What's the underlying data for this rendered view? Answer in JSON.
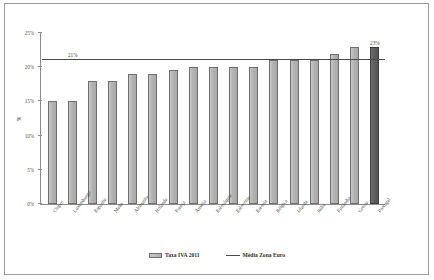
{
  "chart_data": {
    "type": "bar",
    "title": "",
    "subtitle": "",
    "xlabel": "",
    "ylabel": "%",
    "ylim": [
      0,
      25
    ],
    "ytick_labels": [
      "0%",
      "5%",
      "10%",
      "15%",
      "20%",
      "25%"
    ],
    "ytick_values": [
      0,
      5,
      10,
      15,
      20,
      25
    ],
    "grid": false,
    "legend_position": "bottom",
    "categories": [
      "Chipre",
      "Luxemburgo",
      "Espanha",
      "Malta",
      "Alemanha",
      "Holanda",
      "França",
      "Áustria",
      "Eslováquia",
      "Eslovénia",
      "Estónia",
      "Bélgica",
      "Irlanda",
      "Itália",
      "Finlândia",
      "Grécia",
      "Portugal"
    ],
    "values": [
      15,
      15,
      18,
      18,
      19,
      19,
      19.6,
      20,
      20,
      20,
      20,
      21,
      21,
      21,
      22,
      23,
      23
    ],
    "series": [
      {
        "name": "Taxa IVA 2011",
        "values": [
          15,
          15,
          18,
          18,
          19,
          19,
          19.6,
          20,
          20,
          20,
          20,
          21,
          21,
          21,
          22,
          23,
          23
        ]
      }
    ],
    "reference_line": {
      "name": "Média Zona Euro",
      "value": 21,
      "label": "21%"
    },
    "data_labels": {
      "Portugal": "23%"
    },
    "highlight_category": "Portugal",
    "colors": {
      "bar": "#b4b4b4",
      "bar_border": "#6f6f6f",
      "highlight_bar": "#5e5e5e",
      "reference_line": "#4a4a4a",
      "axis": "#8c8c8c",
      "text": "#3a3a3a",
      "background": "#ffffff"
    }
  },
  "legend": {
    "items": [
      {
        "label": "Taxa IVA 2011",
        "type": "bar"
      },
      {
        "label": "Média Zona Euro",
        "type": "line"
      }
    ]
  }
}
